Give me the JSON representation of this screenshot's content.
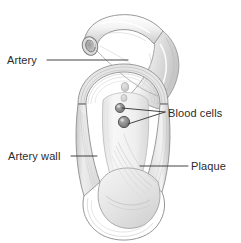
{
  "figure": {
    "style": "pencil-sketch-grayscale",
    "width": 241,
    "height": 243,
    "background_color": "#ffffff",
    "ink_color": "#2b2b2b",
    "shading_color": "#b9b9b9"
  },
  "labels": {
    "artery": {
      "text": "Artery",
      "leader": "line from label right edge to upper artery tube"
    },
    "blood_cells": {
      "text": "Blood cells",
      "leader": "two lines branching from label left edge to two blood cells"
    },
    "artery_wall": {
      "text": "Artery wall",
      "leader": "line from label right edge to left artery wall"
    },
    "plaque": {
      "text": "Plaque",
      "leader": "line from label left edge to plaque interior"
    }
  },
  "structures": [
    {
      "name": "artery-tube",
      "description": "open cut end of artery at top left"
    },
    {
      "name": "artery-bend",
      "description": "curving artery segment descending to the right"
    },
    {
      "name": "artery-wall",
      "description": "layered vessel wall shown in cutaway"
    },
    {
      "name": "lumen",
      "description": "narrowed inner channel of the artery"
    },
    {
      "name": "plaque",
      "description": "fibrous deposit filling the vessel interior"
    },
    {
      "name": "blood-cell",
      "description": "rounded dark cells inside the lumen"
    }
  ]
}
